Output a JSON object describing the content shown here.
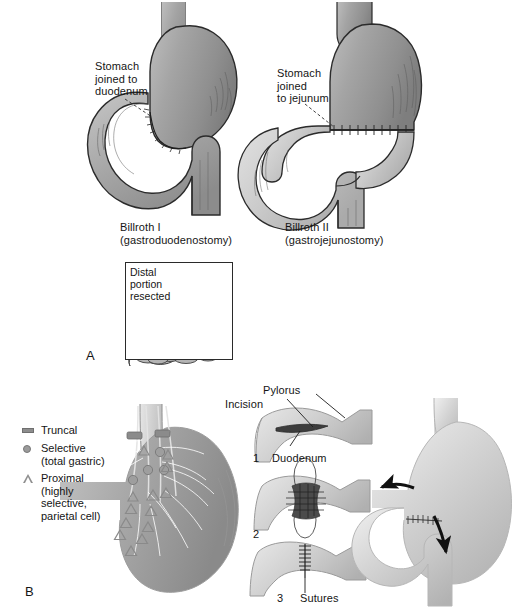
{
  "figure": {
    "panels": [
      {
        "letter": "A",
        "title": "Gastrectomy reconstructions",
        "items": [
          {
            "callout": "Stomach\njoined to\nduodenum",
            "caption_line1": "Billroth I",
            "caption_line2": "(gastroduodenostomy)"
          },
          {
            "callout": "Stomach\njoined\nto jejunum",
            "caption_line1": "Billroth II",
            "caption_line2": "(gastrojejunostomy)"
          }
        ],
        "inset": {
          "label": "Distal\nportion\nresected"
        }
      },
      {
        "letter": "B",
        "title": "Vagotomy types and pyloroplasty",
        "legend": {
          "items": [
            {
              "marker": "bar-icon",
              "label": "Truncal"
            },
            {
              "marker": "circle-icon",
              "label": "Selective\n(total gastric)"
            },
            {
              "marker": "triangle-icon",
              "label": "Proximal\n(highly selective,\nparietal cell)"
            }
          ]
        },
        "steps": [
          {
            "number": "1",
            "labels": [
              "Pylorus",
              "Incision",
              "Duodenum"
            ]
          },
          {
            "number": "2",
            "labels": []
          },
          {
            "number": "3",
            "labels": [
              "Sutures"
            ]
          }
        ]
      }
    ],
    "labels": {
      "stomach_joined_duodenum": "Stomach\njoined to\nduodenum",
      "stomach_joined_jejunum": "Stomach\njoined\nto jejunum",
      "billroth_i": "Billroth I",
      "billroth_i_sub": "(gastroduodenostomy)",
      "billroth_ii": "Billroth II",
      "billroth_ii_sub": "(gastrojejunostomy)",
      "distal_portion_resected": "Distal\nportion\nresected",
      "panel_a": "A",
      "panel_b": "B",
      "truncal": "Truncal",
      "selective": "Selective\n(total gastric)",
      "proximal": "Proximal\n(highly selective,\nparietal cell)",
      "pylorus": "Pylorus",
      "incision": "Incision",
      "duodenum": "Duodenum",
      "sutures": "Sutures",
      "step_1": "1",
      "step_2": "2",
      "step_3": "3"
    },
    "colors": {
      "background": "#ffffff",
      "organ_fill_dark": "#9a9a9a",
      "organ_fill_mid": "#ababab",
      "organ_fill_light": "#c9c9c9",
      "organ_fill_pale": "#d8d8d8",
      "outline": "#2b2b2b",
      "text": "#151515",
      "arrow": "#111111",
      "marker_gray": "#8f8f8f"
    }
  }
}
